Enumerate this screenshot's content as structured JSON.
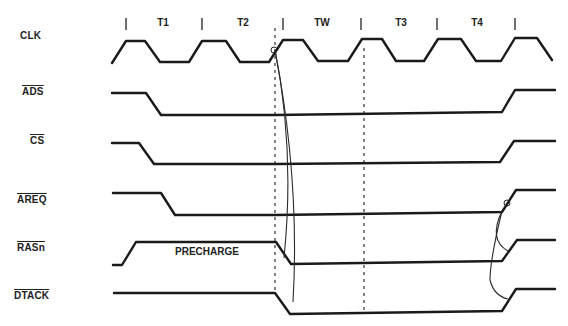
{
  "diagram": {
    "title": "",
    "periods": [
      {
        "label": "T1",
        "x": 163
      },
      {
        "label": "T2",
        "x": 243
      },
      {
        "label": "TW",
        "x": 322
      },
      {
        "label": "T3",
        "x": 401
      },
      {
        "label": "T4",
        "x": 477
      }
    ],
    "period_ticks": [
      126,
      202,
      283,
      361,
      437,
      515
    ],
    "signals": [
      {
        "id": "clk",
        "label": "CLK",
        "overline": false,
        "label_x": 20,
        "label_y": 36
      },
      {
        "id": "ads",
        "label": "ADS",
        "overline": true,
        "label_x": 22,
        "label_y": 92
      },
      {
        "id": "cs",
        "label": "CS",
        "overline": true,
        "label_x": 30,
        "label_y": 141
      },
      {
        "id": "areq",
        "label": "AREQ",
        "overline": true,
        "label_x": 17,
        "label_y": 200
      },
      {
        "id": "rasn",
        "label": "RASn",
        "overline": true,
        "label_x": 17,
        "label_y": 248
      },
      {
        "id": "dtack",
        "label": "DTACK",
        "overline": true,
        "label_x": 14,
        "label_y": 296
      }
    ],
    "annotations": [
      {
        "text": "PRECHARGE",
        "x": 175,
        "y": 252
      }
    ],
    "waveforms": {
      "clk": "M112,63 L126,41 L145,41 L160,62 L189,62 L202,41 L226,41 L240,62 L269,62 L283,40 L303,40 L318,61 L348,61 L362,39 L382,39 L396,61 L424,61 L438,39 L461,39 L476,61 L501,61 L515,38 L537,38 L552,60",
      "ads": "M112,93 L146,93 L161,115 L275,115 L502,112 L515,90 L555,90",
      "cs": "M112,143 L139,143 L154,164 L275,164 L500,162 L514,141 L555,141",
      "areq": "M113,193 L161,193 L175,215 L275,215 L502,212 L516,190 L555,190",
      "rasn": "M113,265 L122,265 L136,242 L276,242 L291,264 L502,261 L517,240 L555,240",
      "dtack": "M114,293 L275,293 L290,314 L502,311 L516,289 L555,289"
    },
    "dashed_lines": [
      {
        "x": 275,
        "y1": 28,
        "y2": 292
      },
      {
        "x": 364,
        "y1": 48,
        "y2": 312
      }
    ],
    "causal_arrows": [
      {
        "from": "clk-rise-T2",
        "to": "rasn-fall",
        "path": "M275,50 Q295,150 284,258"
      },
      {
        "from": "clk-rise-T2",
        "to": "dtack-fall",
        "path": "M275,50 Q300,180 293,302"
      },
      {
        "from": "areq-rise",
        "to": "rasn-rise",
        "path": "M502,211 Q488,240 508,251"
      },
      {
        "from": "areq-rise",
        "to": "dtack-rise",
        "path": "M502,211 Q490,260 490,280 Q494,296 508,299"
      }
    ]
  }
}
